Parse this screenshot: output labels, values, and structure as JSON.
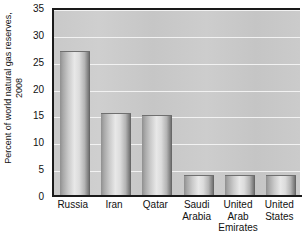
{
  "chart_data": {
    "type": "bar",
    "title": "",
    "subtitle": "",
    "xlabel": "",
    "ylabel": "Percent of world natural gas reserves,\n2008",
    "categories": [
      "Russia",
      "Iran",
      "Qatar",
      "Saudi\nArabia",
      "United\nArab\nEmirates",
      "United\nStates"
    ],
    "values": [
      27,
      15.5,
      15,
      4,
      4,
      4
    ],
    "ylim": [
      0,
      35
    ],
    "ytick_labels": [
      "0",
      "5",
      "10",
      "15",
      "20",
      "25",
      "30",
      "35"
    ],
    "ytick_values": [
      0,
      5,
      10,
      15,
      20,
      25,
      30,
      35
    ],
    "grid": "horizontal",
    "legend": "none",
    "series": [
      {
        "name": "Percent of world natural gas reserves, 2008",
        "values": [
          27,
          15.5,
          15,
          4,
          4,
          4
        ]
      }
    ],
    "colors": {
      "plot_background": "#c9c9c9",
      "gridline": "#f2f2f2",
      "axis": "#1a1a1a",
      "bar_light": "#e8e8e8",
      "bar_dark": "#5e5e5e",
      "text": "#111111",
      "page_background": "#ffffff"
    }
  }
}
